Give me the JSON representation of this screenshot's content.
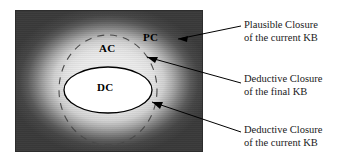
{
  "figure": {
    "panel": {
      "regions": [
        {
          "id": "pc",
          "label": "PC",
          "meaning": "Plausible Closure of the current KB"
        },
        {
          "id": "ac",
          "label": "AC",
          "meaning": "Deductive Closure of the final KB"
        },
        {
          "id": "dc",
          "label": "DC",
          "meaning": "Deductive Closure of the current KB"
        }
      ]
    },
    "annotations": [
      {
        "id": "annot-1",
        "line1": "Plausible Closure",
        "line2": "of the current KB"
      },
      {
        "id": "annot-2",
        "line1": "Deductive Closure",
        "line2": "of the final KB"
      },
      {
        "id": "annot-3",
        "line1": "Deductive Closure",
        "line2": "of the current KB"
      }
    ],
    "colors": {
      "frame": "#3b3b3b",
      "glow_center": "#efefef",
      "glow_edge": "#3a3a3a",
      "inner_ellipse_fill": "#ffffff",
      "outline": "#000000",
      "text": "#1a1a1a"
    }
  }
}
